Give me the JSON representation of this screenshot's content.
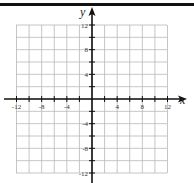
{
  "chart_data": {
    "type": "coordinate-grid",
    "title": "",
    "xlabel": "x",
    "ylabel": "y",
    "xlim": [
      -12,
      12
    ],
    "ylim": [
      -12,
      12
    ],
    "grid_step": 2,
    "grid": true,
    "x_tick_labels": [
      "-12",
      "-8",
      "-4",
      "4",
      "8",
      "12"
    ],
    "x_tick_values": [
      -12,
      -8,
      -4,
      4,
      8,
      12
    ],
    "y_tick_labels": [
      "12",
      "8",
      "4",
      "-4",
      "-8",
      "-12"
    ],
    "y_tick_values": [
      12,
      8,
      4,
      -4,
      -8,
      -12
    ],
    "series": []
  },
  "axes": {
    "x_label": "x",
    "y_label": "y"
  },
  "colors": {
    "grid": "#b8b8b8",
    "axis": "#111111",
    "text": "#333333"
  }
}
